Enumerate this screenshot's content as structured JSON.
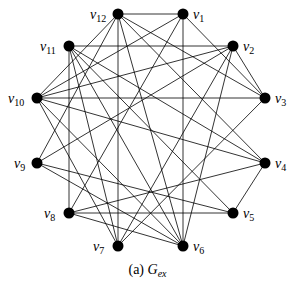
{
  "figure": {
    "caption_prefix": "(a)",
    "caption_graph_name": "G",
    "caption_graph_sub": "ex",
    "edge_color": "#000000",
    "node_color": "#000000"
  },
  "nodes": [
    {
      "id": "v1",
      "name": "v",
      "sub": "1",
      "x": 183,
      "y": 14,
      "lx": 193,
      "ly": 8
    },
    {
      "id": "v2",
      "name": "v",
      "sub": "2",
      "x": 233,
      "y": 46,
      "lx": 243,
      "ly": 40
    },
    {
      "id": "v3",
      "name": "v",
      "sub": "3",
      "x": 265,
      "y": 98,
      "lx": 275,
      "ly": 92
    },
    {
      "id": "v4",
      "name": "v",
      "sub": "4",
      "x": 265,
      "y": 163,
      "lx": 275,
      "ly": 157
    },
    {
      "id": "v5",
      "name": "v",
      "sub": "5",
      "x": 233,
      "y": 213,
      "lx": 243,
      "ly": 207
    },
    {
      "id": "v6",
      "name": "v",
      "sub": "6",
      "x": 183,
      "y": 246,
      "lx": 193,
      "ly": 240
    },
    {
      "id": "v7",
      "name": "v",
      "sub": "7",
      "x": 118,
      "y": 246,
      "lx": 93,
      "ly": 240
    },
    {
      "id": "v8",
      "name": "v",
      "sub": "8",
      "x": 69,
      "y": 213,
      "lx": 44,
      "ly": 207
    },
    {
      "id": "v9",
      "name": "v",
      "sub": "9",
      "x": 37,
      "y": 163,
      "lx": 14,
      "ly": 157
    },
    {
      "id": "v10",
      "name": "v",
      "sub": "10",
      "x": 37,
      "y": 98,
      "lx": 8,
      "ly": 92
    },
    {
      "id": "v11",
      "name": "v",
      "sub": "11",
      "x": 69,
      "y": 46,
      "lx": 40,
      "ly": 40
    },
    {
      "id": "v12",
      "name": "v",
      "sub": "12",
      "x": 118,
      "y": 14,
      "lx": 90,
      "ly": 8
    }
  ],
  "edges": [
    [
      "v12",
      "v1"
    ],
    [
      "v12",
      "v7"
    ],
    [
      "v12",
      "v10"
    ],
    [
      "v12",
      "v3"
    ],
    [
      "v12",
      "v4"
    ],
    [
      "v12",
      "v6"
    ],
    [
      "v12",
      "v9"
    ],
    [
      "v1",
      "v6"
    ],
    [
      "v1",
      "v10"
    ],
    [
      "v1",
      "v3"
    ],
    [
      "v1",
      "v8"
    ],
    [
      "v11",
      "v2"
    ],
    [
      "v11",
      "v8"
    ],
    [
      "v11",
      "v6"
    ],
    [
      "v11",
      "v5"
    ],
    [
      "v11",
      "v7"
    ],
    [
      "v10",
      "v3"
    ],
    [
      "v10",
      "v2"
    ],
    [
      "v10",
      "v4"
    ],
    [
      "v10",
      "v6"
    ],
    [
      "v10",
      "v7"
    ],
    [
      "v2",
      "v3"
    ],
    [
      "v2",
      "v7"
    ],
    [
      "v2",
      "v6"
    ],
    [
      "v2",
      "v9"
    ],
    [
      "v3",
      "v7"
    ],
    [
      "v4",
      "v5"
    ],
    [
      "v4",
      "v8"
    ],
    [
      "v4",
      "v11"
    ],
    [
      "v9",
      "v5"
    ],
    [
      "v9",
      "v6"
    ],
    [
      "v8",
      "v5"
    ],
    [
      "v8",
      "v6"
    ]
  ]
}
